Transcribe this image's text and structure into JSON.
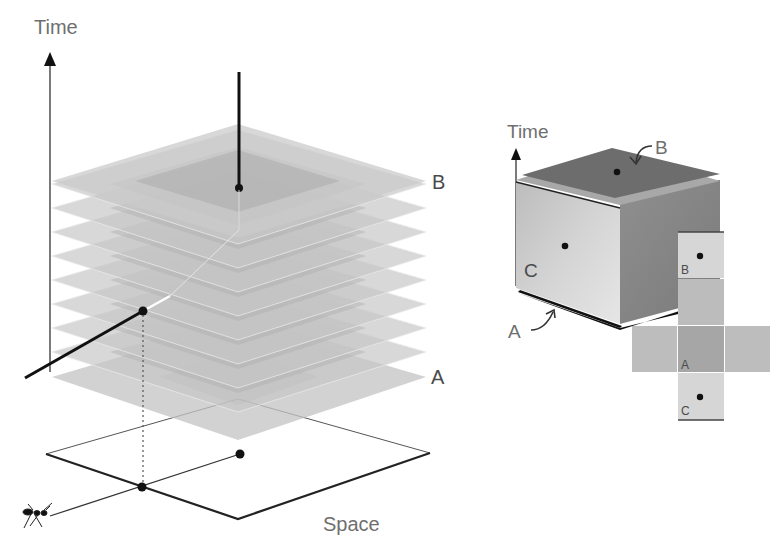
{
  "left_diagram": {
    "time_axis_label": "Time",
    "space_label": "Space",
    "slice_top_label": "B",
    "slice_bottom_label": "A",
    "slice_count": 10
  },
  "right_diagram": {
    "time_axis_label": "Time",
    "top_face_label": "B",
    "bottom_face_label": "A",
    "front_face_label": "C",
    "net_labels": {
      "top": "B",
      "middle": "A",
      "bottom": "C"
    }
  },
  "colors": {
    "slice_fill": "#bdbdbd",
    "slice_inner": "#a9a9a9",
    "cube_top": "#6e6e6e",
    "cube_front": "#c8c8c8",
    "cube_side": "#8a8a8a",
    "cube_base": "#1a1a1a",
    "net_light": "#d6d6d6",
    "net_mid": "#b9b9b9",
    "net_dark": "#a3a3a3",
    "label_gray": "#6f6f6f"
  }
}
